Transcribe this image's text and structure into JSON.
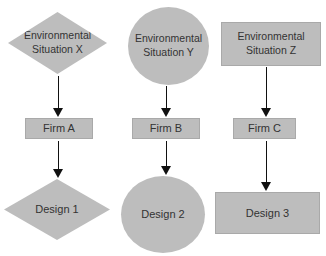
{
  "diagram": {
    "columns": [
      {
        "situation": {
          "label": "Environmental Situation X",
          "shape": "diamond"
        },
        "firm": {
          "label": "Firm A",
          "shape": "rectangle"
        },
        "design": {
          "label": "Design 1",
          "shape": "diamond"
        }
      },
      {
        "situation": {
          "label": "Environmental Situation Y",
          "shape": "circle"
        },
        "firm": {
          "label": "Firm B",
          "shape": "rectangle"
        },
        "design": {
          "label": "Design 2",
          "shape": "circle"
        }
      },
      {
        "situation": {
          "label": "Environmental Situation Z",
          "shape": "rectangle"
        },
        "firm": {
          "label": "Firm C",
          "shape": "rectangle"
        },
        "design": {
          "label": "Design 3",
          "shape": "rectangle"
        }
      }
    ],
    "colors": {
      "shape_fill": "#bdbdbd",
      "shape_border": "#a9a9a9",
      "text": "#333333",
      "arrow": "#111111",
      "background": "#ffffff"
    }
  }
}
